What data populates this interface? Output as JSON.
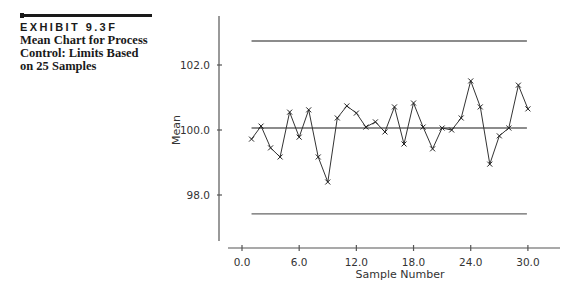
{
  "caption": {
    "exhibit": "EXHIBIT 9.3F",
    "title": "Mean Chart for Process Control: Limits Based on 25 Samples"
  },
  "chart_data": {
    "type": "line",
    "title": "Mean Chart for Process Control: Limits Based on 25 Samples",
    "xlabel": "Sample Number",
    "ylabel": "Mean",
    "x_ticks": [
      "0.0",
      "6.0",
      "12.0",
      "18.0",
      "24.0",
      "30.0"
    ],
    "y_ticks": [
      "98.0",
      "100.0",
      "102.0"
    ],
    "xlim": [
      -1.5,
      33.3
    ],
    "ylim": [
      96.6,
      103.5
    ],
    "grid": false,
    "marker": "x",
    "x": [
      1,
      2,
      3,
      4,
      5,
      6,
      7,
      8,
      9,
      10,
      11,
      12,
      13,
      14,
      15,
      16,
      17,
      18,
      19,
      20,
      21,
      22,
      23,
      24,
      25,
      26,
      27,
      28,
      29,
      30
    ],
    "series": [
      {
        "name": "Sample Mean",
        "values": [
          99.72,
          100.12,
          99.45,
          99.17,
          100.55,
          99.78,
          100.62,
          99.17,
          98.4,
          100.37,
          100.74,
          100.52,
          100.09,
          100.25,
          99.94,
          100.71,
          99.57,
          100.83,
          100.09,
          99.42,
          100.06,
          100.0,
          100.37,
          101.51,
          100.71,
          98.95,
          99.82,
          100.06,
          101.38,
          100.65
        ]
      }
    ],
    "control_lines": {
      "UCL": 102.74,
      "CL": 100.06,
      "LCL": 97.42,
      "x_range": [
        1,
        30
      ]
    }
  }
}
